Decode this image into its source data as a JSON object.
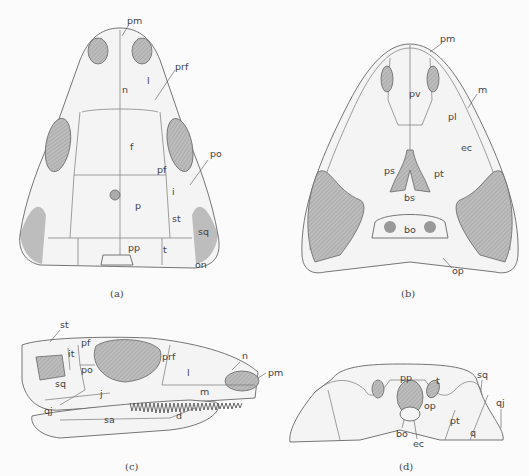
{
  "figure": {
    "panels": [
      {
        "id": "a",
        "caption": "(a)",
        "view": "dorsal skull roof",
        "labels": [
          "pm",
          "prf",
          "n",
          "l",
          "f",
          "po",
          "pf",
          "i",
          "p",
          "st",
          "sq",
          "pp",
          "t",
          "on"
        ]
      },
      {
        "id": "b",
        "caption": "(b)",
        "view": "palatal view",
        "labels": [
          "pm",
          "m",
          "pv",
          "pl",
          "ec",
          "ps",
          "pt",
          "bs",
          "bo",
          "op"
        ]
      },
      {
        "id": "c",
        "caption": "(c)",
        "view": "lateral view",
        "labels": [
          "st",
          "it",
          "pf",
          "po",
          "prf",
          "n",
          "pm",
          "sq",
          "j",
          "l",
          "m",
          "qj",
          "sa",
          "d"
        ]
      },
      {
        "id": "d",
        "caption": "(d)",
        "view": "occipital view",
        "labels": [
          "pp",
          "t",
          "sq",
          "op",
          "qj",
          "pt",
          "bo",
          "ec",
          "q"
        ]
      }
    ]
  },
  "labels": {
    "a": {
      "pm": "pm",
      "prf": "prf",
      "n": "n",
      "l": "l",
      "f": "f",
      "po": "po",
      "pf": "pf",
      "i": "i",
      "p": "p",
      "st": "st",
      "sq": "sq",
      "pp": "pp",
      "t": "t",
      "on": "on",
      "caption": "(a)"
    },
    "b": {
      "pm": "pm",
      "m": "m",
      "pv": "pv",
      "pl": "pl",
      "ec": "ec",
      "ps": "ps",
      "pt": "pt",
      "bs": "bs",
      "bo": "bo",
      "op": "op",
      "caption": "(b)"
    },
    "c": {
      "st": "st",
      "it": "it",
      "pf": "pf",
      "po": "po",
      "prf": "prf",
      "n": "n",
      "pm": "pm",
      "sq": "sq",
      "j": "j",
      "l": "l",
      "m": "m",
      "qj": "qj",
      "sa": "sa",
      "d": "d",
      "caption": "(c)"
    },
    "d": {
      "pp": "pp",
      "t": "t",
      "sq": "sq",
      "op": "op",
      "qj": "qj",
      "pt": "pt",
      "bo": "bo",
      "ec": "ec",
      "q": "q",
      "caption": "(d)"
    }
  }
}
